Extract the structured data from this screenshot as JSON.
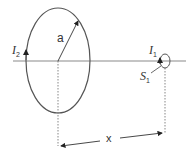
{
  "diagram": {
    "labels": {
      "current_large": {
        "symbol": "I",
        "subscript": "2"
      },
      "radius": "a",
      "current_small": {
        "symbol": "I",
        "subscript": "1"
      },
      "area_small": {
        "symbol": "S",
        "subscript": "1"
      },
      "distance": "x"
    },
    "colors": {
      "line": "#555555",
      "axis": "#888888"
    }
  }
}
